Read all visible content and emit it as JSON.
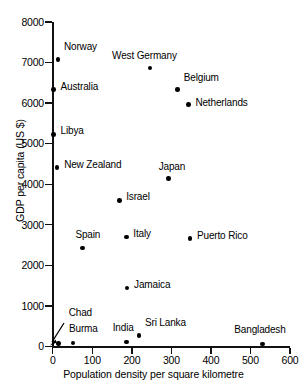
{
  "chart_data": {
    "type": "scatter",
    "title": "",
    "xlabel": "Population density per square kilometre",
    "ylabel": "GDP per capita (US $)",
    "xlim": [
      0,
      600
    ],
    "ylim": [
      0,
      8000
    ],
    "xticks": [
      0,
      100,
      200,
      300,
      400,
      500,
      600
    ],
    "yticks": [
      0,
      1000,
      2000,
      3000,
      4000,
      5000,
      6000,
      7000,
      8000
    ],
    "xtick_labels": [
      "0",
      "100",
      "200",
      "300",
      "400",
      "500",
      "600"
    ],
    "ytick_labels": [
      "0",
      "1000",
      "2000",
      "3000",
      "4000",
      "5000",
      "6000",
      "7000",
      "8000"
    ],
    "grid": false,
    "legend": "none",
    "marker_color": "#000000",
    "axis_color": "#111111",
    "points": [
      {
        "label": "Norway",
        "x": 13,
        "y": 7080,
        "label_dx": 6,
        "label_dy": -13
      },
      {
        "label": "West Germany",
        "x": 246,
        "y": 6870,
        "label_dx": -38,
        "label_dy": -13
      },
      {
        "label": "Australia",
        "x": 2,
        "y": 6330,
        "label_dx": 7,
        "label_dy": -4
      },
      {
        "label": "Belgium",
        "x": 316,
        "y": 6340,
        "label_dx": 6,
        "label_dy": -12
      },
      {
        "label": "Netherlands",
        "x": 343,
        "y": 5960,
        "label_dx": 7,
        "label_dy": -3
      },
      {
        "label": "Libya",
        "x": 2,
        "y": 5230,
        "label_dx": 7,
        "label_dy": -4
      },
      {
        "label": "New Zealand",
        "x": 11,
        "y": 4410,
        "label_dx": 7,
        "label_dy": -4
      },
      {
        "label": "Japan",
        "x": 293,
        "y": 4140,
        "label_dx": -10,
        "label_dy": -13
      },
      {
        "label": "Israel",
        "x": 168,
        "y": 3600,
        "label_dx": 7,
        "label_dy": -4
      },
      {
        "label": "Puerto Rico",
        "x": 347,
        "y": 2660,
        "label_dx": 7,
        "label_dy": -4
      },
      {
        "label": "Italy",
        "x": 186,
        "y": 2700,
        "label_dx": 7,
        "label_dy": -4
      },
      {
        "label": "Spain",
        "x": 75,
        "y": 2430,
        "label_dx": -7,
        "label_dy": -14
      },
      {
        "label": "Jamaica",
        "x": 188,
        "y": 1440,
        "label_dx": 7,
        "label_dy": -4
      },
      {
        "label": "Sri Lanka",
        "x": 218,
        "y": 270,
        "label_dx": 6,
        "label_dy": -13
      },
      {
        "label": "India",
        "x": 187,
        "y": 105,
        "label_dx": -14,
        "label_dy": -15
      },
      {
        "label": "Burma",
        "x": 51,
        "y": 85,
        "label_dx": -4,
        "label_dy": -15
      },
      {
        "label": "Chad",
        "x": 15,
        "y": 70,
        "label_dx": 10,
        "label_dy": -32
      },
      {
        "label": "Bangladesh",
        "x": 530,
        "y": 60,
        "label_dx": -28,
        "label_dy": -15
      }
    ],
    "annotations": [
      {
        "name": "chad-leader-arrow",
        "from_label": "Chad",
        "to_point": "Chad"
      }
    ]
  }
}
